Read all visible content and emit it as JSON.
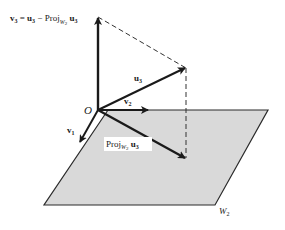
{
  "figure": {
    "origin_label": "O",
    "vectors": {
      "v1": {
        "label": "v",
        "sub": "1"
      },
      "v2": {
        "label": "v",
        "sub": "2"
      },
      "u3": {
        "label": "u",
        "sub": "3"
      },
      "v3": {
        "lhs": "v",
        "lhs_sub": "3",
        "eq": " = ",
        "u": "u",
        "u_sub": "3",
        "minus": " − Proj",
        "proj_sub": "W",
        "proj_sub_sub": "2",
        "tail": " u",
        "tail_sub": "3"
      },
      "proj": {
        "label": "Proj",
        "sub": "W",
        "sub_sub": "2",
        "u": " u",
        "u_sub": "3"
      }
    },
    "plane": {
      "label": "W",
      "sub": "2",
      "fill": "#d9d9d9",
      "edge": "#2a2a2a"
    },
    "colors": {
      "arrow": "#1a1a1a",
      "dashed": "#333333"
    }
  }
}
